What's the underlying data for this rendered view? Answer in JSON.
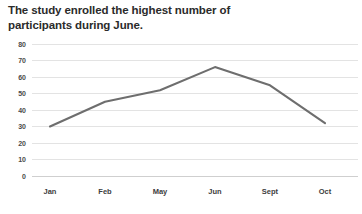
{
  "chart_data": {
    "type": "line",
    "title": "The study enrolled the highest number of\nparticipants during June.",
    "categories": [
      "Jan",
      "Feb",
      "May",
      "Jun",
      "Sept",
      "Oct"
    ],
    "values": [
      30,
      45,
      52,
      66,
      55,
      32
    ],
    "series": [
      {
        "name": "Participants enrolled",
        "values": [
          30,
          45,
          52,
          66,
          55,
          32
        ]
      }
    ],
    "xlabel": "",
    "ylabel": "",
    "ylim": [
      0,
      80
    ],
    "yticks": [
      0,
      10,
      20,
      30,
      40,
      50,
      60,
      70,
      80
    ],
    "ytick_labels": [
      "0",
      "10",
      "20",
      "30",
      "40",
      "50",
      "60",
      "70",
      "80"
    ],
    "grid": true,
    "legend": false,
    "line_color": "#6e6e6e",
    "grid_color": "#e3e3e3",
    "background_color": "#ffffff",
    "title_color": "#2b2b2b"
  }
}
